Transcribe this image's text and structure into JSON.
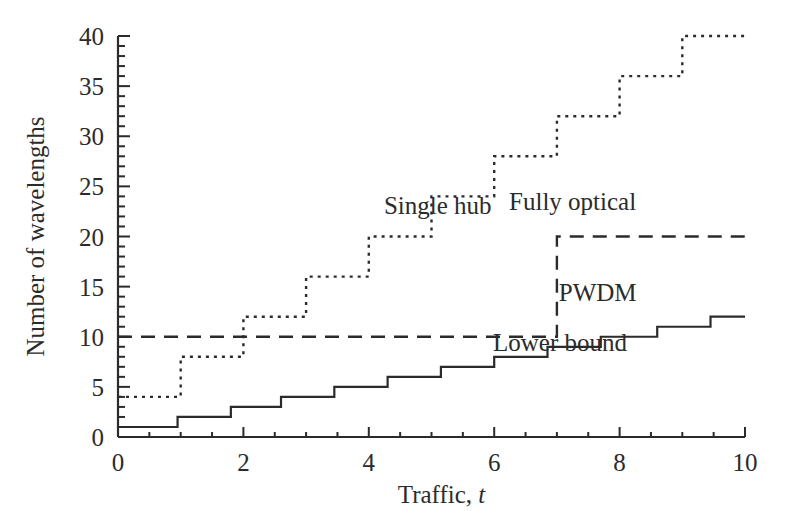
{
  "chart_data": {
    "type": "line",
    "title": "",
    "xlabel": "Traffic, t",
    "ylabel": "Number of wavelengths",
    "xlim": [
      0,
      10
    ],
    "ylim": [
      0,
      40
    ],
    "grid": false,
    "legend_position": "inline-annotations",
    "x_ticks_major": [
      0,
      2,
      4,
      6,
      8,
      10
    ],
    "x_tick_labels": [
      "0",
      "2",
      "4",
      "6",
      "8",
      "10"
    ],
    "x_minor_tick_step": 0.5,
    "y_ticks_major": [
      0,
      5,
      10,
      15,
      20,
      25,
      30,
      35,
      40
    ],
    "y_tick_labels": [
      "0",
      "5",
      "10",
      "15",
      "20",
      "25",
      "30",
      "35",
      "40"
    ],
    "y_minor_tick_step": 1,
    "series": [
      {
        "name": "Single hub",
        "style": "dotted",
        "color": "#2b2b2b",
        "step": "post",
        "x": [
          0,
          1,
          2,
          3,
          4,
          5,
          6,
          7,
          8,
          9,
          10
        ],
        "values": [
          4,
          8,
          12,
          16,
          20,
          24,
          28,
          32,
          36,
          40,
          40
        ],
        "label_x": 5.1,
        "label_y": 22.2
      },
      {
        "name": "Fully optical",
        "style": "dashed",
        "color": "#2b2b2b",
        "step": "post",
        "x": [
          0,
          7,
          10
        ],
        "values": [
          10,
          20,
          20
        ],
        "label_x": 7.25,
        "label_y": 22.6
      },
      {
        "name": "PWDM",
        "style": "solid",
        "color": "#2b2b2b",
        "step": "post",
        "x": [
          0,
          0.95,
          1.8,
          2.6,
          3.45,
          4.3,
          5.15,
          6.0,
          6.85,
          7.7,
          8.6,
          9.45,
          10
        ],
        "values": [
          1,
          2,
          3,
          4,
          5,
          6,
          7,
          8,
          9,
          10,
          11,
          12,
          12
        ],
        "label_x": 7.65,
        "label_y": 13.6
      },
      {
        "name": "Lower bound",
        "style": "solid",
        "color": "#2b2b2b",
        "note": "same curve as PWDM; second annotation",
        "label_x": 7.05,
        "label_y": 8.6
      }
    ]
  },
  "axes": {
    "x_label_text": "Traffic,",
    "x_label_symbol": "t",
    "y_label_text": "Number of wavelengths"
  },
  "annotations": {
    "single_hub": "Single hub",
    "fully_optical": "Fully optical",
    "pwdm": "PWDM",
    "lower_bound": "Lower bound"
  },
  "colors": {
    "ink": "#2b2b2b",
    "background": "#ffffff"
  }
}
